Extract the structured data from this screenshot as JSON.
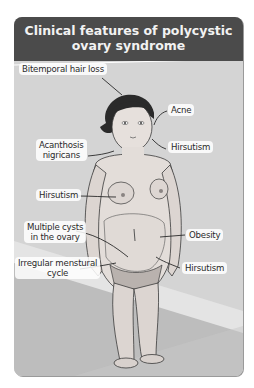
{
  "title": {
    "line1": "Clinical features of polycystic",
    "line2": "ovary syndrome"
  },
  "labels": {
    "bitemporal_hair_loss": "Bitemporal hair loss",
    "acne": "Acne",
    "acanthosis_line1": "Acanthosis",
    "acanthosis_line2": "nigricans",
    "hirsutism_face": "Hirsutism",
    "hirsutism_chest": "Hirsutism",
    "multiple_cysts_line1": "Multiple cysts",
    "multiple_cysts_line2": "in the ovary",
    "obesity": "Obesity",
    "irregular_line1": "Irregular menstural",
    "irregular_line2": "cycle",
    "hirsutism_lower": "Hirsutism"
  },
  "colors": {
    "header_bg": "#4b4b4b",
    "header_text": "#f2f2f2",
    "scene_bg": "#cfcfcf",
    "label_bg": "#ffffff"
  }
}
